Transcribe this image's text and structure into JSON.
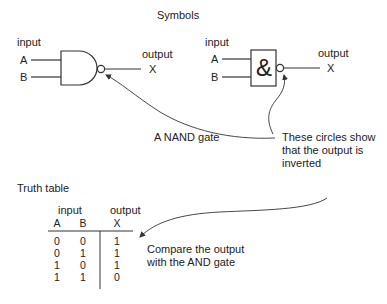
{
  "title": "Symbols",
  "nand_symbol_us": {
    "input_label": "input",
    "input_a": "A",
    "input_b": "B",
    "output_label": "output",
    "output_x": "X"
  },
  "nand_symbol_iec": {
    "input_label": "input",
    "input_a": "A",
    "input_b": "B",
    "gate_symbol": "&",
    "output_label": "output",
    "output_x": "X"
  },
  "annotations": {
    "nand_gate": "A NAND gate",
    "circles_line1": "These circles show",
    "circles_line2": "that the output is",
    "circles_line3": "inverted",
    "compare_line1": "Compare the output",
    "compare_line2": "with the AND gate"
  },
  "truth_table": {
    "title": "Truth table",
    "group_headers": {
      "input": "input",
      "output": "output"
    },
    "columns": [
      "A",
      "B",
      "X"
    ],
    "rows": [
      [
        "0",
        "0",
        "1"
      ],
      [
        "0",
        "1",
        "1"
      ],
      [
        "1",
        "0",
        "1"
      ],
      [
        "1",
        "1",
        "0"
      ]
    ]
  },
  "colors": {
    "stroke": "#333333",
    "text": "#222222",
    "background": "#ffffff"
  }
}
